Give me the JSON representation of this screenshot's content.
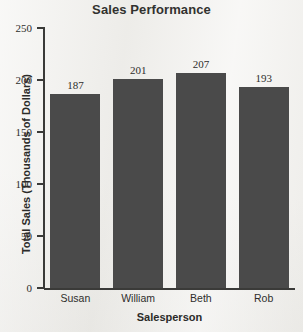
{
  "chart_data": {
    "type": "bar",
    "title": "Sales Performance",
    "xlabel": "Salesperson",
    "ylabel": "Total Sales (Thousands of Dollars)",
    "categories": [
      "Susan",
      "William",
      "Beth",
      "Rob"
    ],
    "values": [
      187,
      201,
      207,
      193
    ],
    "value_labels": [
      "187",
      "201",
      "207",
      "193"
    ],
    "ylim": [
      0,
      250
    ],
    "ytick_values": [
      0,
      50,
      100,
      150,
      200,
      250
    ],
    "ytick_labels": [
      "0",
      "50",
      "100",
      "150",
      "200",
      "250"
    ],
    "grid": false,
    "legend": false,
    "bar_color": "#4a4a4a",
    "axis_color": "#3a3a38",
    "background_color": "#f1f0ed"
  }
}
